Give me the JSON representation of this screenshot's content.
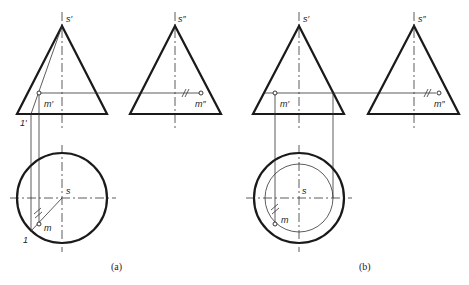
{
  "figure": {
    "panels": [
      {
        "id": "a",
        "caption": "(a)",
        "front_view": {
          "apex_label": "s′",
          "point_label": "m′",
          "generator_label": "1′"
        },
        "side_view": {
          "apex_label": "s″",
          "point_label": "m″"
        },
        "top_view": {
          "center_label": "s",
          "point_label": "m",
          "generator_label": "1"
        }
      },
      {
        "id": "b",
        "caption": "(b)",
        "front_view": {
          "apex_label": "s′",
          "point_label": "m′"
        },
        "side_view": {
          "apex_label": "s″",
          "point_label": "m″"
        },
        "top_view": {
          "center_label": "s",
          "point_label": "m"
        }
      }
    ]
  }
}
